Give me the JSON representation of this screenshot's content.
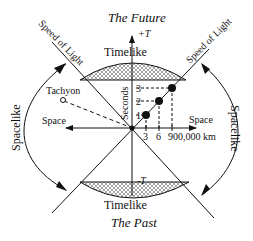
{
  "diagram": {
    "title_top": "The Future",
    "title_bottom": "The Past",
    "plus_t": "+T",
    "minus_t": "-T",
    "timelike_top": "Timelike",
    "timelike_bottom": "Timelike",
    "spacelike_left": "Spacelike",
    "spacelike_right": "Spacelike",
    "speed_of_light_left": "Speed of Light",
    "speed_of_light_right": "Speed of Light",
    "tachyon": "Tachyon",
    "space_left": "Space",
    "space_right": "Space",
    "seconds": "Seconds",
    "y_ticks": [
      "1",
      "2",
      "3"
    ],
    "x_ticks": [
      "3",
      "6",
      "900,000 km"
    ],
    "colors": {
      "ink": "#111111",
      "background": "#ffffff",
      "hatch": "#555555"
    }
  }
}
